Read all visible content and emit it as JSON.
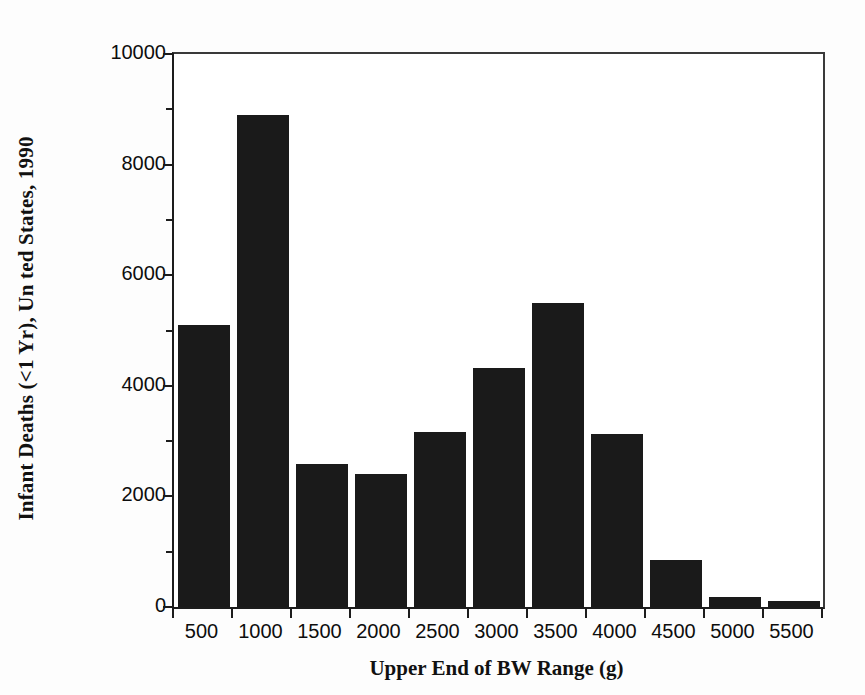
{
  "chart_data": {
    "type": "bar",
    "title": "",
    "subtitle": "",
    "xlabel": "Upper End of BW Range (g)",
    "ylabel": "Infant Deaths (<1 Yr), Un ted States, 1990",
    "categories": [
      "500",
      "1000",
      "1500",
      "2000",
      "2500",
      "3000",
      "3500",
      "4000",
      "4500",
      "5000",
      "5500"
    ],
    "values": [
      5100,
      8900,
      2590,
      2400,
      3160,
      4320,
      5500,
      3120,
      850,
      190,
      110
    ],
    "ylim": [
      0,
      10000
    ],
    "ytick_labels": [
      "0",
      "2000",
      "4000",
      "6000",
      "8000",
      "10000"
    ],
    "ytick_values": [
      0,
      2000,
      4000,
      6000,
      8000,
      10000
    ],
    "yminor_values": [
      1000,
      3000,
      5000,
      7000,
      9000
    ],
    "grid": false,
    "legend": false,
    "legend_position": "none",
    "bar_color": "#1a1a1a",
    "axis_color": "#1c1c1c",
    "background_color": "#ffffff"
  }
}
